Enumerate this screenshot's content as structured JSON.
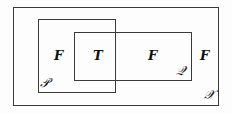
{
  "figure": {
    "type": "venn-diagram",
    "background_color": "#fdfdfd",
    "stroke_color": "#3a3a3a",
    "text_color": "#101010"
  },
  "sets": {
    "universe": {
      "label": "ᵏ3",
      "label_display": "𝒳",
      "name": "X"
    },
    "p": {
      "label_display": "𝒫",
      "name": "P"
    },
    "q": {
      "label_display": "𝒬",
      "name": "Q"
    }
  },
  "region_labels": {
    "f_left": "F",
    "t_center": "T",
    "f_right": "F",
    "f_outer": "F"
  }
}
